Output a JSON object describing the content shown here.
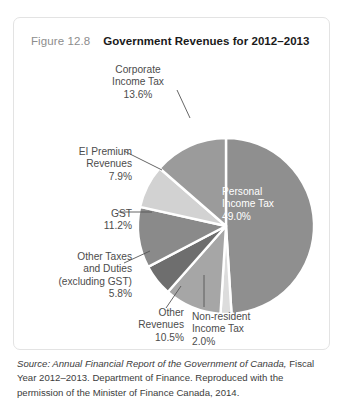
{
  "figure": {
    "number": "Figure 12.8",
    "title": "Government Revenues for 2012–2013"
  },
  "source": {
    "italic_part": "Source: Annual Financial Report of the Government of Canada,",
    "rest_part": " Fiscal Year 2012–2013. Department of Finance. Reproduced with the permission of the Minister of Finance Canada, 2014."
  },
  "labels": {
    "corporate": "Corporate\nIncome Tax\n13.6%",
    "ei": "EI Premium\nRevenues\n7.9%",
    "gst": "GST\n11.2%",
    "other_taxes": "Other Taxes\nand Duties\n(excluding GST)\n5.8%",
    "other_revenues": "Other\nRevenues\n10.5%",
    "nonresident": "Non-resident\nIncome Tax\n2.0%",
    "personal": "Personal\nIncome Tax\n49.0%"
  },
  "colors": {
    "background": "#ffffff",
    "card_border": "#e3e3e3",
    "figure_number": "#8d8d8d",
    "title": "#1a1a1a",
    "label_text": "#4c4c4c",
    "inside_label_text": "#ffffff",
    "slice_gap": "#ffffff",
    "leader_line": "#555555"
  },
  "chart_data": {
    "type": "pie",
    "title": "Government Revenues for 2012–2013",
    "unit": "percent",
    "start_angle_deg": 0,
    "direction": "clockwise",
    "gap_stroke_px": 2.4,
    "legend": "none",
    "labels_position": "callout",
    "categories": [
      "Personal Income Tax",
      "Non-resident Income Tax",
      "Other Revenues",
      "Other Taxes and Duties (excluding GST)",
      "GST",
      "EI Premium Revenues",
      "Corporate Income Tax"
    ],
    "values": [
      49.0,
      2.0,
      10.5,
      5.8,
      11.2,
      7.9,
      13.6
    ],
    "slice_colors": [
      "#8f8f8f",
      "#dcdcdc",
      "#a6a6a6",
      "#6e6e6e",
      "#8a8a8a",
      "#d2d2d2",
      "#9b9b9b"
    ],
    "slices": [
      {
        "name": "Personal Income Tax",
        "value": 49.0,
        "display": "49.0%",
        "color": "#8f8f8f",
        "label_inside": true
      },
      {
        "name": "Non-resident Income Tax",
        "value": 2.0,
        "display": "2.0%",
        "color": "#dcdcdc",
        "label_inside": false
      },
      {
        "name": "Other Revenues",
        "value": 10.5,
        "display": "10.5%",
        "color": "#a6a6a6",
        "label_inside": false
      },
      {
        "name": "Other Taxes and Duties (excluding GST)",
        "value": 5.8,
        "display": "5.8%",
        "color": "#6e6e6e",
        "label_inside": false
      },
      {
        "name": "GST",
        "value": 11.2,
        "display": "11.2%",
        "color": "#8a8a8a",
        "label_inside": false
      },
      {
        "name": "EI Premium Revenues",
        "value": 7.9,
        "display": "7.9%",
        "color": "#d2d2d2",
        "label_inside": false
      },
      {
        "name": "Corporate Income Tax",
        "value": 13.6,
        "display": "13.6%",
        "color": "#9b9b9b",
        "label_inside": false
      }
    ]
  },
  "geometry": {
    "center_x": 212,
    "center_y": 208,
    "radius": 88
  }
}
